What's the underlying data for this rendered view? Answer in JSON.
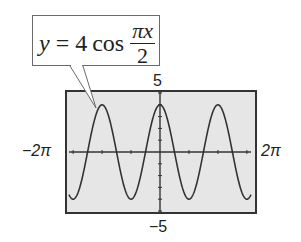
{
  "callout": {
    "lhs": "y",
    "equals": "=",
    "coef": "4",
    "func": "cos",
    "numerator": "πx",
    "denominator": "2"
  },
  "labels": {
    "ymax": "5",
    "ymin": "−5",
    "xmin": "−2π",
    "xmax": "2π"
  },
  "colors": {
    "background": "#ffffff",
    "plot_background": "#e6e6e6",
    "curve": "#333333",
    "frame": "#333333"
  },
  "chart_data": {
    "type": "line",
    "function": "4*cos(pi*x/2)",
    "xlabel": "",
    "ylabel": "",
    "xlim": [
      -6.2832,
      6.2832
    ],
    "ylim": [
      -5,
      5
    ],
    "x_tick_labels": [
      "−2π",
      "2π"
    ],
    "y_tick_labels": [
      "5",
      "−5"
    ],
    "x_tick_step": 1,
    "y_tick_step": 1,
    "grid": false,
    "amplitude": 4,
    "period": 4,
    "series": [
      {
        "name": "y = 4cos(πx/2)",
        "x": [
          -6.28,
          -6,
          -5,
          -4,
          -3,
          -2,
          -1,
          0,
          1,
          2,
          3,
          4,
          5,
          6,
          6.28
        ],
        "y": [
          -3.91,
          -4,
          0,
          4,
          0,
          -4,
          0,
          4,
          0,
          -4,
          0,
          4,
          0,
          -4,
          -3.91
        ]
      }
    ],
    "annotations": [
      "callout box with equation y = 4 cos(πx/2) pointing to the curve"
    ]
  }
}
